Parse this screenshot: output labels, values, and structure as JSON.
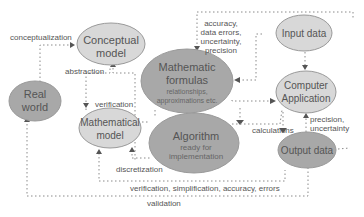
{
  "diagram": {
    "colors": {
      "light_node_fill": "#d8d8d8",
      "dark_node_fill": "#a8a8a8",
      "node_stroke": "#9a9a9a",
      "edge": "#8a8a8a",
      "text": "#555555"
    },
    "nodes": {
      "real_world": {
        "line1": "Real",
        "line2": "world"
      },
      "conceptual_model": {
        "line1": "Conceptual",
        "line2": "model"
      },
      "mathematical_model": {
        "line1": "Mathematical",
        "line2": "model"
      },
      "mathematic_formulas": {
        "line1": "Mathematic",
        "line2": "formulas",
        "sub1": "relationships,",
        "sub2": "approximations etc."
      },
      "algorithm": {
        "line1": "Algorithm",
        "sub1": "ready for",
        "sub2": "implementation"
      },
      "input_data": {
        "line1": "Input data"
      },
      "computer_application": {
        "line1": "Computer",
        "line2": "Application"
      },
      "output_data": {
        "line1": "Output data"
      }
    },
    "edge_labels": {
      "conceptualization": "conceptualization",
      "abstraction": "abstraction",
      "verification": "verification",
      "input_quality_1": "accuracy,",
      "input_quality_2": "data errors,",
      "input_quality_3": "uncertainty,",
      "input_quality_4": "precision",
      "discretization": "discretization",
      "calculations": "calculations",
      "precision": "precision,",
      "uncertainty": "uncertainty",
      "verification_chain": "verification, simplification, accuracy, errors",
      "validation": "validation"
    }
  }
}
